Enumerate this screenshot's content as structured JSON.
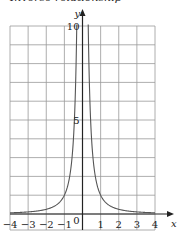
{
  "title": "Inverse relationship",
  "chart_data": {
    "type": "line",
    "title": "Inverse relationship",
    "xlabel": "x",
    "ylabel": "y",
    "xlim": [
      -4,
      4
    ],
    "ylim": [
      0,
      10
    ],
    "grid": true,
    "x_ticks": [
      -4,
      -3,
      -2,
      -1,
      0,
      1,
      2,
      3,
      4
    ],
    "x_tick_labels": [
      "−4",
      "−3",
      "−2",
      "−1",
      "0",
      "1",
      "2",
      "3",
      "4"
    ],
    "y_ticks": [
      5,
      10
    ],
    "y_tick_labels": [
      "5",
      "10"
    ],
    "series": [
      {
        "name": "y = 1/x²",
        "x": [
          -4,
          -3,
          -2,
          -1.5,
          -1,
          -0.75,
          -0.5,
          -0.4,
          -0.32,
          0.32,
          0.4,
          0.5,
          0.75,
          1,
          1.5,
          2,
          3,
          4
        ],
        "y": [
          0.06,
          0.11,
          0.25,
          0.44,
          1,
          1.78,
          4,
          6.25,
          9.77,
          9.77,
          6.25,
          4,
          1.78,
          1,
          0.44,
          0.25,
          0.11,
          0.06
        ]
      }
    ],
    "legend": "none"
  }
}
